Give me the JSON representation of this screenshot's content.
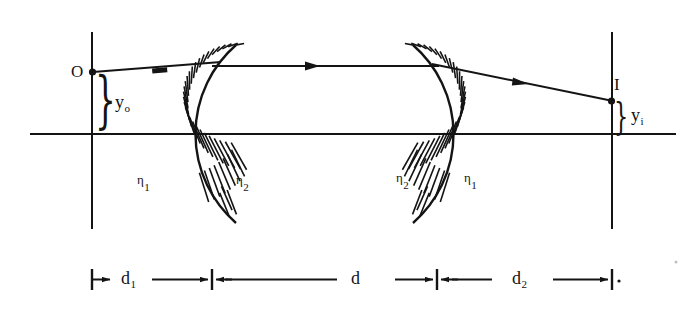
{
  "figure": {
    "type": "optics-ray-diagram",
    "ink_color": "#141414",
    "background_color": "#ffffff"
  },
  "labels": {
    "object_point": "O",
    "image_point": "I",
    "object_height": {
      "base": "y",
      "subscript": "o"
    },
    "image_height": {
      "base": "y",
      "subscript": "i"
    },
    "index_outside_left": {
      "base": "η",
      "subscript": "1"
    },
    "index_inside_left": {
      "base": "η",
      "subscript": "2"
    },
    "index_inside_right": {
      "base": "η",
      "subscript": "2"
    },
    "index_outside_right": {
      "base": "η",
      "subscript": "1"
    }
  },
  "dimensions": [
    {
      "id": "d1",
      "base": "d",
      "subscript": "1",
      "label": "d₁"
    },
    {
      "id": "d",
      "base": "d",
      "subscript": "",
      "label": "d"
    },
    {
      "id": "d2",
      "base": "d",
      "subscript": "2",
      "label": "d₂"
    }
  ],
  "geometry": {
    "optical_axis_y": 134,
    "object_plane_x": 92,
    "image_plane_x": 612,
    "object_point_y": 72,
    "image_point_y": 101,
    "surface1_vertex_x": 212,
    "surface2_vertex_x": 437,
    "ray_heights": {
      "incident_at_surface1_y": 64,
      "internal_y": 66,
      "exit_at_surface2_y": 66
    }
  }
}
